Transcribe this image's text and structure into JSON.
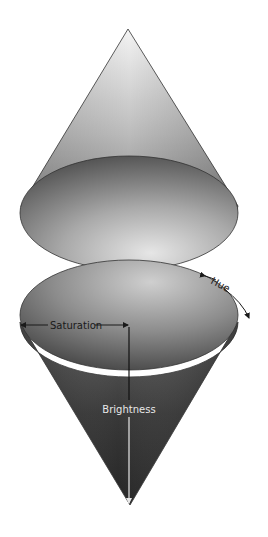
{
  "diagram": {
    "labels": {
      "hue": "Hue",
      "saturation": "Saturation",
      "brightness": "Brightness"
    },
    "colors": {
      "background": "#ffffff",
      "outline": "#333333",
      "arrow_dark": "#1a1a1a",
      "arrow_light": "#e8e8e8",
      "top_cone_light": "#f2f2f2",
      "top_cone_dark": "#6a6a6a",
      "bottom_cone_dark": "#1e1e1e",
      "bottom_cone_mid": "#555555"
    },
    "shapes": [
      {
        "name": "top-cone",
        "apex": [
          128,
          29
        ],
        "base_center": [
          129,
          213
        ],
        "rx": 109,
        "ry": 57
      },
      {
        "name": "bottom-cone",
        "apex": [
          130,
          505
        ],
        "base_center": [
          129,
          315
        ],
        "rx": 109,
        "ry": 55
      }
    ]
  }
}
